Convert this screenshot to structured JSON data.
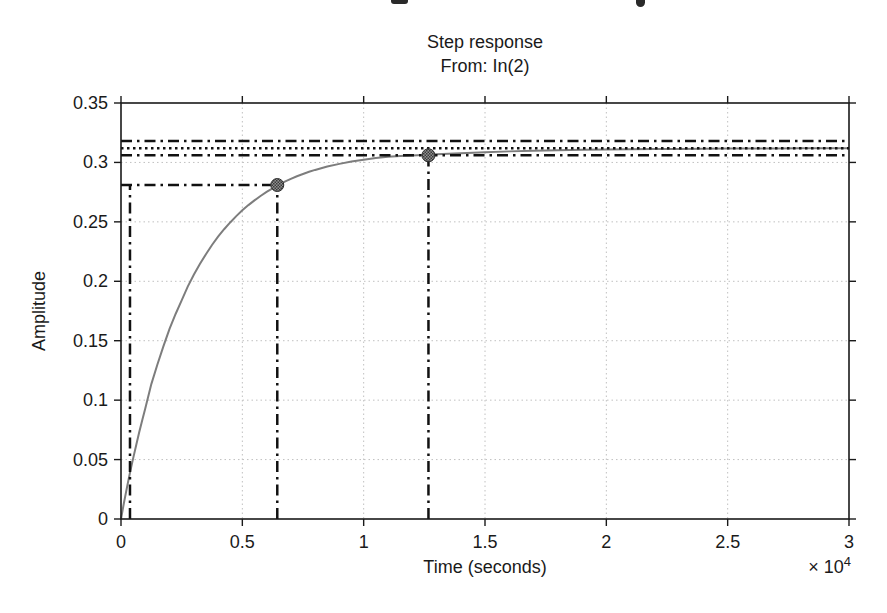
{
  "page": {
    "top_edge_artifacts": [
      "cropped-text-descender-pp",
      "cropped-text-descender-g"
    ]
  },
  "colors": {
    "background": "#ffffff",
    "axis": "#1a1a1a",
    "grid": "#c0c0c0",
    "curve": "#7d7d7d",
    "reference": "#111111",
    "marker_fill": "#909090",
    "marker_edge": "#2e2e2e"
  },
  "chart_data": {
    "type": "line",
    "title": "Step response",
    "subtitle": "From: In(2)",
    "xlabel": "Time (seconds)",
    "ylabel": "Amplitude",
    "x_axis_multiplier": {
      "base": "× 10",
      "exponent": "4"
    },
    "xlim": [
      0,
      30000
    ],
    "ylim": [
      0,
      0.35
    ],
    "grid": true,
    "legend_position": "none",
    "x_ticks": {
      "values": [
        0,
        5000,
        10000,
        15000,
        20000,
        25000,
        30000
      ],
      "labels": [
        "0",
        "0.5",
        "1",
        "1.5",
        "2",
        "2.5",
        "3"
      ]
    },
    "y_ticks": {
      "values": [
        0,
        0.05,
        0.1,
        0.15,
        0.2,
        0.25,
        0.3,
        0.35
      ],
      "labels": [
        "0",
        "0.05",
        "0.1",
        "0.15",
        "0.2",
        "0.25",
        "0.3",
        "0.35"
      ]
    },
    "steady_state_value": 0.312,
    "settling_bounds": [
      0.306,
      0.318
    ],
    "rise_reference_amplitude": 0.281,
    "series": [
      {
        "name": "step-response-curve",
        "color": "#7d7d7d",
        "points": [
          [
            0,
            0
          ],
          [
            120,
            0.0135
          ],
          [
            250,
            0.027
          ],
          [
            380,
            0.04
          ],
          [
            500,
            0.051
          ],
          [
            630,
            0.0625
          ],
          [
            750,
            0.073
          ],
          [
            880,
            0.0835
          ],
          [
            1000,
            0.093
          ],
          [
            1250,
            0.1135
          ],
          [
            1500,
            0.13
          ],
          [
            1750,
            0.1455
          ],
          [
            2000,
            0.16
          ],
          [
            2250,
            0.1725
          ],
          [
            2500,
            0.184
          ],
          [
            2750,
            0.1955
          ],
          [
            3000,
            0.2055
          ],
          [
            3250,
            0.2145
          ],
          [
            3500,
            0.2228
          ],
          [
            3750,
            0.2305
          ],
          [
            4000,
            0.2375
          ],
          [
            4250,
            0.2438
          ],
          [
            4500,
            0.2495
          ],
          [
            4750,
            0.2548
          ],
          [
            5000,
            0.2597
          ],
          [
            5250,
            0.2641
          ],
          [
            5500,
            0.2681
          ],
          [
            5750,
            0.2718
          ],
          [
            6000,
            0.2752
          ],
          [
            6440,
            0.2805
          ],
          [
            6750,
            0.2838
          ],
          [
            7000,
            0.2862
          ],
          [
            7250,
            0.2884
          ],
          [
            7500,
            0.2903
          ],
          [
            7750,
            0.2921
          ],
          [
            8000,
            0.2937
          ],
          [
            8500,
            0.2965
          ],
          [
            9000,
            0.2988
          ],
          [
            9500,
            0.3007
          ],
          [
            10000,
            0.3023
          ],
          [
            10500,
            0.3037
          ],
          [
            11000,
            0.3048
          ],
          [
            11500,
            0.3054
          ],
          [
            12000,
            0.3059
          ],
          [
            12670,
            0.3064
          ],
          [
            13000,
            0.3068
          ],
          [
            13500,
            0.3073
          ],
          [
            14000,
            0.3078
          ],
          [
            15000,
            0.3086
          ],
          [
            16000,
            0.3093
          ],
          [
            17000,
            0.3098
          ],
          [
            18000,
            0.3103
          ],
          [
            19000,
            0.3106
          ],
          [
            20000,
            0.3109
          ],
          [
            21000,
            0.3111
          ],
          [
            22000,
            0.3113
          ],
          [
            23000,
            0.3114
          ],
          [
            24000,
            0.3116
          ],
          [
            25000,
            0.3117
          ],
          [
            26000,
            0.3118
          ],
          [
            27000,
            0.3118
          ],
          [
            28000,
            0.3119
          ],
          [
            29000,
            0.3119
          ],
          [
            30000,
            0.312
          ]
        ]
      }
    ],
    "reference_lines": [
      {
        "name": "upper-settling-bound",
        "orientation": "h",
        "value": 0.318,
        "style": "dashdot",
        "t_start": 0,
        "t_end": 30000
      },
      {
        "name": "steady-state-line",
        "orientation": "h",
        "value": 0.312,
        "style": "dotted",
        "t_start": 0,
        "t_end": 30000
      },
      {
        "name": "lower-settling-bound",
        "orientation": "h",
        "value": 0.306,
        "style": "dashdot",
        "t_start": 0,
        "t_end": 30000
      },
      {
        "name": "rise-amplitude-line",
        "orientation": "h",
        "value": 0.281,
        "style": "dashdot",
        "t_start": 0,
        "t_end": 6440
      },
      {
        "name": "rise-start-time-line",
        "orientation": "v",
        "value": 370,
        "style": "dashdot",
        "y_start": 0,
        "y_end": 0.281
      },
      {
        "name": "rise-end-time-line",
        "orientation": "v",
        "value": 6440,
        "style": "dashdot",
        "y_start": 0,
        "y_end": 0.281
      },
      {
        "name": "settling-time-line",
        "orientation": "v",
        "value": 12670,
        "style": "dashdot",
        "y_start": 0,
        "y_end": 0.306
      }
    ],
    "markers": [
      {
        "name": "rise-time-marker",
        "t": 6440,
        "y": 0.281
      },
      {
        "name": "settling-time-marker",
        "t": 12670,
        "y": 0.306
      }
    ]
  }
}
